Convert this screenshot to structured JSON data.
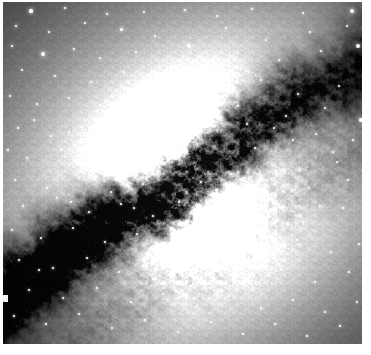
{
  "image": {
    "kind": "astronomical-photograph",
    "subject_label": "Centaurus A galaxy with central dust lane",
    "color_mode": "grayscale",
    "width_px": 371,
    "height_px": 355,
    "frame": {
      "border_color": "#ffffff",
      "left_px": 3,
      "top_px": 2,
      "right_margin_px": 9,
      "bottom_margin_px": 11,
      "content_width_px": 359,
      "content_height_px": 342
    },
    "palette": {
      "sky_background": "#050505",
      "deep_dust": "#0a0a0a",
      "mid_halo": "#8a8a8a",
      "bright_halo": "#d8d8d8",
      "core_saturated": "#ffffff",
      "star_color": "#ffffff"
    },
    "features": {
      "core_bright_peak": {
        "x": 202,
        "y": 222,
        "label": "southern-core-lobe"
      },
      "secondary_bright_peak": {
        "x": 176,
        "y": 140,
        "label": "northern-core-lobe"
      },
      "dust_lane": {
        "label": "dark dust lane",
        "orientation_degrees": -32,
        "from": {
          "x": 0,
          "y": 300
        },
        "to": {
          "x": 359,
          "y": 60
        }
      },
      "edge_defect": {
        "x": 0,
        "y": 293,
        "width": 5,
        "height": 7,
        "label": "left-edge-artifact"
      }
    },
    "star_count_visible": 148,
    "stars": [
      [
        28,
        9,
        1.6
      ],
      [
        62,
        6,
        1.2
      ],
      [
        104,
        12,
        1.4
      ],
      [
        141,
        10,
        1.1
      ],
      [
        182,
        8,
        1.3
      ],
      [
        214,
        14,
        1.0
      ],
      [
        249,
        7,
        1.2
      ],
      [
        300,
        11,
        1.1
      ],
      [
        349,
        9,
        2.0
      ],
      [
        13,
        24,
        1.3
      ],
      [
        46,
        30,
        1.2
      ],
      [
        82,
        21,
        1.0
      ],
      [
        118,
        27,
        1.5
      ],
      [
        152,
        34,
        1.1
      ],
      [
        186,
        44,
        2.2
      ],
      [
        223,
        26,
        1.0
      ],
      [
        263,
        38,
        1.1
      ],
      [
        307,
        30,
        1.2
      ],
      [
        344,
        24,
        1.0
      ],
      [
        9,
        44,
        1.4
      ],
      [
        40,
        52,
        1.9
      ],
      [
        71,
        47,
        1.1
      ],
      [
        97,
        56,
        1.2
      ],
      [
        133,
        50,
        1.0
      ],
      [
        168,
        62,
        1.1
      ],
      [
        205,
        55,
        1.2
      ],
      [
        238,
        66,
        1.0
      ],
      [
        276,
        58,
        1.1
      ],
      [
        318,
        49,
        1.3
      ],
      [
        355,
        44,
        2.1
      ],
      [
        19,
        68,
        1.2
      ],
      [
        52,
        74,
        1.1
      ],
      [
        88,
        80,
        1.3
      ],
      [
        121,
        70,
        1.0
      ],
      [
        149,
        84,
        1.1
      ],
      [
        190,
        76,
        1.2
      ],
      [
        228,
        88,
        1.0
      ],
      [
        258,
        78,
        1.1
      ],
      [
        295,
        92,
        1.2
      ],
      [
        336,
        84,
        1.0
      ],
      [
        7,
        94,
        1.3
      ],
      [
        34,
        102,
        1.1
      ],
      [
        66,
        96,
        1.0
      ],
      [
        100,
        110,
        1.2
      ],
      [
        136,
        104,
        1.1
      ],
      [
        172,
        116,
        1.0
      ],
      [
        211,
        108,
        1.1
      ],
      [
        244,
        122,
        1.0
      ],
      [
        283,
        114,
        1.1
      ],
      [
        322,
        106,
        1.2
      ],
      [
        358,
        118,
        1.8
      ],
      [
        15,
        126,
        1.2
      ],
      [
        48,
        134,
        1.4
      ],
      [
        80,
        128,
        1.1
      ],
      [
        112,
        140,
        1.0
      ],
      [
        146,
        132,
        1.1
      ],
      [
        252,
        146,
        1.0
      ],
      [
        290,
        138,
        1.1
      ],
      [
        330,
        150,
        1.2
      ],
      [
        24,
        156,
        1.3
      ],
      [
        58,
        148,
        1.1
      ],
      [
        92,
        162,
        1.2
      ],
      [
        126,
        154,
        1.0
      ],
      [
        296,
        168,
        1.1
      ],
      [
        334,
        160,
        1.0
      ],
      [
        12,
        178,
        1.2
      ],
      [
        44,
        186,
        1.1
      ],
      [
        76,
        176,
        1.0
      ],
      [
        108,
        190,
        1.1
      ],
      [
        140,
        182,
        1.0
      ],
      [
        306,
        186,
        1.1
      ],
      [
        345,
        178,
        1.2
      ],
      [
        20,
        204,
        1.3
      ],
      [
        54,
        196,
        1.1
      ],
      [
        86,
        210,
        1.2
      ],
      [
        118,
        202,
        1.0
      ],
      [
        150,
        214,
        1.1
      ],
      [
        268,
        208,
        1.0
      ],
      [
        300,
        220,
        1.1
      ],
      [
        340,
        206,
        1.2
      ],
      [
        9,
        228,
        1.2
      ],
      [
        38,
        236,
        1.1
      ],
      [
        70,
        226,
        1.0
      ],
      [
        102,
        240,
        1.2
      ],
      [
        134,
        232,
        1.1
      ],
      [
        166,
        244,
        1.0
      ],
      [
        230,
        236,
        1.1
      ],
      [
        262,
        248,
        1.0
      ],
      [
        294,
        238,
        1.1
      ],
      [
        328,
        250,
        1.2
      ],
      [
        356,
        242,
        1.0
      ],
      [
        16,
        258,
        1.1
      ],
      [
        50,
        266,
        1.3
      ],
      [
        84,
        256,
        1.0
      ],
      [
        116,
        270,
        1.1
      ],
      [
        148,
        262,
        1.0
      ],
      [
        180,
        274,
        1.1
      ],
      [
        212,
        264,
        1.0
      ],
      [
        246,
        276,
        1.1
      ],
      [
        278,
        268,
        1.0
      ],
      [
        312,
        280,
        1.2
      ],
      [
        346,
        270,
        1.1
      ],
      [
        26,
        288,
        1.2
      ],
      [
        60,
        296,
        1.1
      ],
      [
        94,
        286,
        1.0
      ],
      [
        128,
        300,
        1.4
      ],
      [
        160,
        292,
        1.1
      ],
      [
        194,
        304,
        1.0
      ],
      [
        226,
        294,
        1.1
      ],
      [
        258,
        306,
        1.0
      ],
      [
        290,
        298,
        1.1
      ],
      [
        322,
        310,
        1.2
      ],
      [
        354,
        300,
        1.0
      ],
      [
        11,
        314,
        1.1
      ],
      [
        43,
        322,
        1.0
      ],
      [
        76,
        312,
        1.1
      ],
      [
        109,
        326,
        1.0
      ],
      [
        142,
        318,
        1.1
      ],
      [
        175,
        330,
        1.0
      ],
      [
        208,
        320,
        1.1
      ],
      [
        240,
        332,
        1.0
      ],
      [
        272,
        322,
        1.1
      ],
      [
        304,
        334,
        1.0
      ],
      [
        337,
        324,
        1.1
      ],
      [
        199,
        130,
        1.2
      ],
      [
        158,
        96,
        1.1
      ],
      [
        235,
        104,
        1.0
      ],
      [
        271,
        126,
        1.1
      ],
      [
        313,
        132,
        1.0
      ],
      [
        66,
        130,
        1.0
      ],
      [
        31,
        118,
        1.1
      ],
      [
        198,
        180,
        1.0
      ],
      [
        176,
        200,
        1.0
      ],
      [
        214,
        188,
        1.0
      ],
      [
        245,
        170,
        1.0
      ],
      [
        155,
        170,
        1.0
      ],
      [
        122,
        120,
        1.0
      ],
      [
        89,
        146,
        1.0
      ],
      [
        187,
        252,
        1.2
      ],
      [
        153,
        240,
        1.0
      ],
      [
        219,
        258,
        1.0
      ],
      [
        281,
        190,
        1.0
      ],
      [
        317,
        204,
        1.0
      ],
      [
        350,
        138,
        1.1
      ],
      [
        5,
        148,
        1.0
      ],
      [
        68,
        200,
        1.0
      ],
      [
        36,
        268,
        1.0
      ],
      [
        101,
        178,
        1.0
      ],
      [
        131,
        206,
        1.0
      ]
    ]
  }
}
